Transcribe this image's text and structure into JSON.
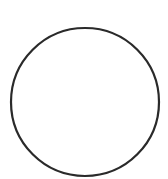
{
  "shape": {
    "type": "circle",
    "cx": 85,
    "cy": 102,
    "r": 74,
    "stroke": "#2a2a2a",
    "stroke_width": 2.2,
    "fill": "none"
  },
  "background": "#ffffff"
}
